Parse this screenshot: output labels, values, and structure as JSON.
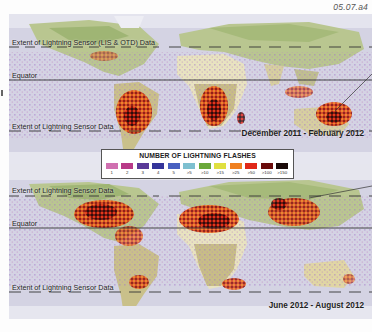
{
  "figure_id": "05.07.a4",
  "legend": {
    "title": "NUMBER OF LIGHTNING FLASHES",
    "items": [
      {
        "label": "1",
        "color": "#d070b0"
      },
      {
        "label": "2",
        "color": "#b83a88"
      },
      {
        "label": "3",
        "color": "#5a3a98"
      },
      {
        "label": "4",
        "color": "#35359a"
      },
      {
        "label": "5",
        "color": "#4860c0"
      },
      {
        "label": ">5",
        "color": "#7ec0d0"
      },
      {
        "label": ">10",
        "color": "#6aa83a"
      },
      {
        "label": ">15",
        "color": "#e0e040"
      },
      {
        "label": ">25",
        "color": "#f08020"
      },
      {
        "label": ">50",
        "color": "#e02818"
      },
      {
        "label": ">100",
        "color": "#6a0a0a"
      },
      {
        "label": ">150",
        "color": "#1a0a08"
      }
    ]
  },
  "maps": [
    {
      "season": "December 2011 - February 2012",
      "labels": {
        "north_extent": "Extent of  Lightning Sensor (LIS & OTD) Data",
        "equator": "Equator",
        "south_extent": "Extent of Lightning Sensor Data"
      }
    },
    {
      "season": "June 2012 - August 2012",
      "labels": {
        "north_extent": "Extent of Lightning Sensor Data",
        "equator": "Equator",
        "south_extent": "Extent of Lightning Sensor Data"
      }
    }
  ]
}
